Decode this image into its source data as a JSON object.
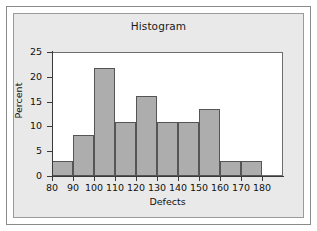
{
  "figure": {
    "title": "Histogram",
    "background_color": "#e9e9e9",
    "plot_background_color": "#ffffff",
    "bar_fill_color": "#adadad",
    "bar_edge_color": "#555555",
    "axis_color": "#3a3a3a"
  },
  "chart_data": {
    "type": "bar",
    "title": "Histogram",
    "xlabel": "Defects",
    "ylabel": "Percent",
    "xlim": [
      80,
      190
    ],
    "ylim": [
      0,
      25
    ],
    "xticks": [
      80,
      90,
      100,
      110,
      120,
      130,
      140,
      150,
      160,
      170,
      180
    ],
    "yticks": [
      0,
      5,
      10,
      15,
      20,
      25
    ],
    "grid": false,
    "legend": null,
    "bin_width": 10,
    "bins": [
      {
        "label": "80",
        "bin_start": 80,
        "bin_end": 90,
        "value": 3.0
      },
      {
        "label": "90",
        "bin_start": 90,
        "bin_end": 100,
        "value": 8.2
      },
      {
        "label": "100",
        "bin_start": 100,
        "bin_end": 110,
        "value": 21.8
      },
      {
        "label": "110",
        "bin_start": 110,
        "bin_end": 120,
        "value": 10.9
      },
      {
        "label": "120",
        "bin_start": 120,
        "bin_end": 130,
        "value": 16.2
      },
      {
        "label": "130",
        "bin_start": 130,
        "bin_end": 140,
        "value": 10.9
      },
      {
        "label": "140",
        "bin_start": 140,
        "bin_end": 150,
        "value": 10.9
      },
      {
        "label": "150",
        "bin_start": 150,
        "bin_end": 160,
        "value": 13.6
      },
      {
        "label": "160",
        "bin_start": 160,
        "bin_end": 170,
        "value": 3.0
      },
      {
        "label": "170",
        "bin_start": 170,
        "bin_end": 180,
        "value": 3.0
      }
    ],
    "categories": [
      "80-90",
      "90-100",
      "100-110",
      "110-120",
      "120-130",
      "130-140",
      "140-150",
      "150-160",
      "160-170",
      "170-180"
    ],
    "values": [
      3.0,
      8.2,
      21.8,
      10.9,
      16.2,
      10.9,
      10.9,
      13.6,
      3.0,
      3.0
    ]
  }
}
